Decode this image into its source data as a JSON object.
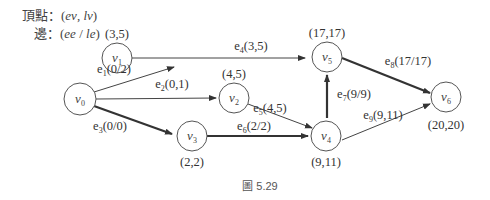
{
  "legend": {
    "vertex_label": "頂點：",
    "vertex_format_open": "(",
    "vertex_ev": "ev",
    "vertex_sep": ", ",
    "vertex_lv": "lv",
    "vertex_format_close": ")",
    "edge_label": "邊：",
    "edge_format_open": "(",
    "edge_ee": "ee",
    "edge_sep": " / ",
    "edge_le": "le",
    "edge_format_close": ")"
  },
  "nodes": [
    {
      "id": "v0",
      "base": "v",
      "sub": "0",
      "times": ""
    },
    {
      "id": "v1",
      "base": "v",
      "sub": "1",
      "times": "(3,5)"
    },
    {
      "id": "v2",
      "base": "v",
      "sub": "2",
      "times": "(4,5)"
    },
    {
      "id": "v3",
      "base": "v",
      "sub": "3",
      "times": "(2,2)"
    },
    {
      "id": "v4",
      "base": "v",
      "sub": "4",
      "times": "(9,11)"
    },
    {
      "id": "v5",
      "base": "v",
      "sub": "5",
      "times": "(17,17)"
    },
    {
      "id": "v6",
      "base": "v",
      "sub": "6",
      "times": "(20,20)"
    }
  ],
  "edges": [
    {
      "id": "e1",
      "base": "e",
      "sub": "1",
      "value": "(0/2)",
      "from": "v0",
      "to": "v1",
      "critical": false
    },
    {
      "id": "e2",
      "base": "e",
      "sub": "2",
      "value": "(0,1)",
      "from": "v0",
      "to": "v2",
      "critical": false
    },
    {
      "id": "e3",
      "base": "e",
      "sub": "3",
      "value": "(0/0)",
      "from": "v0",
      "to": "v3",
      "critical": true
    },
    {
      "id": "e4",
      "base": "e",
      "sub": "4",
      "value": "(3,5)",
      "from": "v1",
      "to": "v5",
      "critical": false
    },
    {
      "id": "e5",
      "base": "e",
      "sub": "5",
      "value": "(4,5)",
      "from": "v2",
      "to": "v4",
      "critical": false
    },
    {
      "id": "e6",
      "base": "e",
      "sub": "6",
      "value": "(2/2)",
      "from": "v3",
      "to": "v4",
      "critical": true
    },
    {
      "id": "e7",
      "base": "e",
      "sub": "7",
      "value": "(9/9)",
      "from": "v4",
      "to": "v5",
      "critical": true
    },
    {
      "id": "e8",
      "base": "e",
      "sub": "8",
      "value": "(17/17)",
      "from": "v5",
      "to": "v6",
      "critical": true
    },
    {
      "id": "e9",
      "base": "e",
      "sub": "9",
      "value": "(9,11)",
      "from": "v4",
      "to": "v6",
      "critical": false
    }
  ],
  "caption": "圖 5.29"
}
